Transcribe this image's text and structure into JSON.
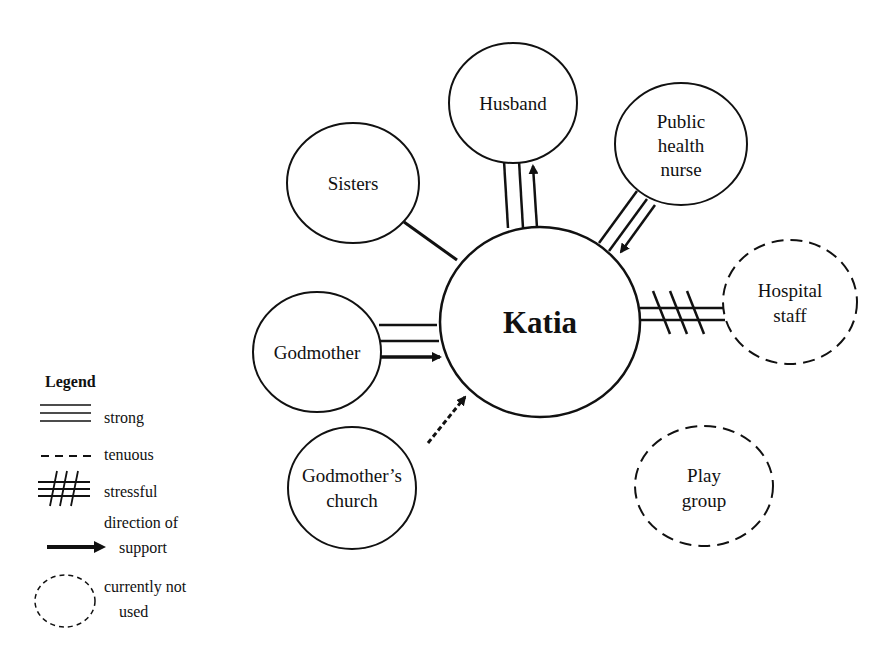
{
  "diagram": {
    "type": "ecomap",
    "center": {
      "label": "Katia",
      "cx": 540,
      "cy": 322,
      "rx": 100,
      "ry": 95
    },
    "nodes": [
      {
        "id": "husband",
        "label_lines": [
          "Husband"
        ],
        "cx": 513,
        "cy": 50,
        "rx": 63,
        "ry": 62,
        "dashed": false,
        "connection": "strong",
        "support": "to-node"
      },
      {
        "id": "sisters",
        "label_lines": [
          "Sisters"
        ],
        "cx": 353,
        "cy": 183,
        "rx": 66,
        "ry": 60,
        "dashed": false,
        "connection": "normal",
        "support": "none"
      },
      {
        "id": "public-health-nurse",
        "label_lines": [
          "Public",
          "health",
          "nurse"
        ],
        "cx": 681,
        "cy": 144,
        "rx": 66,
        "ry": 61,
        "dashed": false,
        "connection": "strong",
        "support": "to-center"
      },
      {
        "id": "hospital-staff",
        "label_lines": [
          "Hospital",
          "staff"
        ],
        "cx": 790,
        "cy": 299,
        "rx": 67,
        "ry": 62,
        "dashed": true,
        "connection": "stressful",
        "support": "none"
      },
      {
        "id": "godmother",
        "label_lines": [
          "Godmother"
        ],
        "cx": 317,
        "cy": 352,
        "rx": 64,
        "ry": 60,
        "dashed": false,
        "connection": "strong",
        "support": "to-center"
      },
      {
        "id": "godmothers-church",
        "label_lines": [
          "Godmother’s",
          "church"
        ],
        "cx": 352,
        "cy": 484,
        "rx": 64,
        "ry": 61,
        "dashed": false,
        "connection": "tenuous",
        "support": "to-center"
      },
      {
        "id": "play-group",
        "label_lines": [
          "Play",
          "group"
        ],
        "cx": 704,
        "cy": 486,
        "rx": 69,
        "ry": 60,
        "dashed": true,
        "connection": "none",
        "support": "none"
      }
    ]
  },
  "legend": {
    "title": "Legend",
    "items": [
      {
        "symbol": "strong",
        "label_lines": [
          "strong"
        ]
      },
      {
        "symbol": "tenuous",
        "label_lines": [
          "tenuous"
        ]
      },
      {
        "symbol": "stressful",
        "label_lines": [
          "stressful"
        ]
      },
      {
        "symbol": "arrow",
        "label_lines": [
          "direction of",
          "support"
        ]
      },
      {
        "symbol": "dashed-circle",
        "label_lines": [
          "currently not",
          "used"
        ]
      }
    ]
  },
  "colors": {
    "line": "#111111",
    "background": "#ffffff"
  }
}
